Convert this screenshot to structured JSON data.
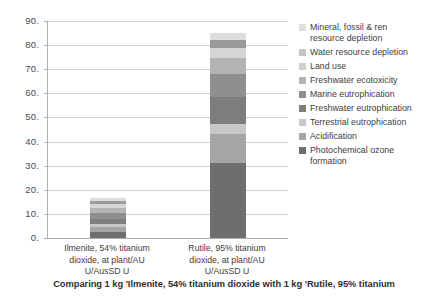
{
  "chart_data": {
    "type": "bar",
    "stacked": true,
    "title": "",
    "caption": "Comparing 1 kg 'Ilmenite, 54% titanium dioxide with 1 kg 'Rutile, 95% titanium",
    "xlabel": "",
    "ylabel": "",
    "ylim": [
      0,
      90
    ],
    "yticks": [
      0,
      10,
      20,
      30,
      40,
      50,
      60,
      70,
      80,
      90
    ],
    "ytick_labels": [
      "0.",
      "10.",
      "20.",
      "30.",
      "40.",
      "50.",
      "60.",
      "70.",
      "80.",
      "90."
    ],
    "grid": true,
    "legend_position": "right",
    "categories": [
      "Ilmenite, 54% titanium\ndioxide, at plant/AU\nU/AusSD U",
      "Rutile, 95% titanium\ndioxide, at plant/AU\nU/AusSD U"
    ],
    "series": [
      {
        "name": "Photochemical ozone formation",
        "color": "#6e6e6e",
        "values": [
          2.6,
          31.0
        ]
      },
      {
        "name": "Acidification",
        "color": "#a5a5a5",
        "values": [
          2.1,
          12.0
        ]
      },
      {
        "name": "Terrestrial eutrophication",
        "color": "#c8c8c8",
        "values": [
          1.1,
          4.5
        ]
      },
      {
        "name": "Freshwater eutrophication",
        "color": "#7d7d7d",
        "values": [
          2.3,
          11.0
        ]
      },
      {
        "name": "Marine eutrophication",
        "color": "#8f8f8f",
        "values": [
          2.2,
          9.5
        ]
      },
      {
        "name": "Freshwater ecotoxicity",
        "color": "#b4b4b4",
        "values": [
          2.0,
          6.5
        ]
      },
      {
        "name": "Land use",
        "color": "#d5d5d5",
        "values": [
          1.8,
          4.5
        ]
      },
      {
        "name": "Water resource depletion",
        "color": "#9a9a9a",
        "values": [
          1.3,
          3.0
        ]
      },
      {
        "name": "Mineral, fossil & ren resource depletion",
        "color": "#dedede",
        "values": [
          1.1,
          3.0
        ]
      }
    ],
    "totals": [
      16.5,
      85.0
    ]
  },
  "legend": {
    "items": [
      {
        "label": "Mineral, fossil & ren\nresource depletion",
        "color": "#dedede"
      },
      {
        "label": "Water resource depletion",
        "color": "#c6c6c6"
      },
      {
        "label": "Land use",
        "color": "#d0d0d0"
      },
      {
        "label": "Freshwater ecotoxicity",
        "color": "#b4b4b4"
      },
      {
        "label": "Marine eutrophication",
        "color": "#8f8f8f"
      },
      {
        "label": "Freshwater eutrophication",
        "color": "#7d7d7d"
      },
      {
        "label": "Terrestrial eutrophication",
        "color": "#c8c8c8"
      },
      {
        "label": "Acidification",
        "color": "#a5a5a5"
      },
      {
        "label": "Photochemical ozone\nformation",
        "color": "#6e6e6e"
      }
    ]
  }
}
